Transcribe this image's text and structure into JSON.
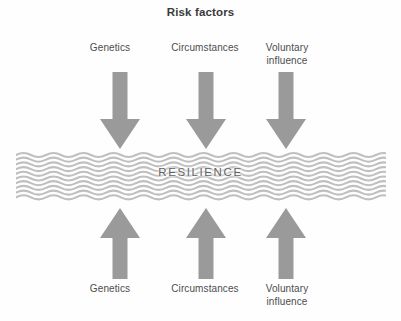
{
  "figure": {
    "title": "Risk factors",
    "center_word": "RESILIENCE",
    "background_color": "#fefefe",
    "arrow_color": "#9a9a9a",
    "wave_color": "#bfbfbf",
    "text_color": "#4d4d4d",
    "title_color": "#3a3a3a"
  },
  "top_group": {
    "heading": "Risk factors",
    "labels": [
      {
        "text": "Genetics"
      },
      {
        "text": "Circumstances"
      },
      {
        "text": "Voluntary\ninfluence"
      }
    ],
    "arrows": [
      {
        "direction": "down",
        "name": "genetics"
      },
      {
        "direction": "down",
        "name": "circumstances"
      },
      {
        "direction": "down",
        "name": "voluntary-influence"
      }
    ]
  },
  "bottom_group": {
    "labels": [
      {
        "text": "Genetics"
      },
      {
        "text": "Circumstances"
      },
      {
        "text": "Voluntary\ninfluence"
      }
    ],
    "arrows": [
      {
        "direction": "up",
        "name": "genetics"
      },
      {
        "direction": "up",
        "name": "circumstances"
      },
      {
        "direction": "up",
        "name": "voluntary-influence"
      }
    ]
  },
  "wave_band": {
    "line_count": 10,
    "wavelength_px": 30,
    "amplitude_px": 3
  }
}
